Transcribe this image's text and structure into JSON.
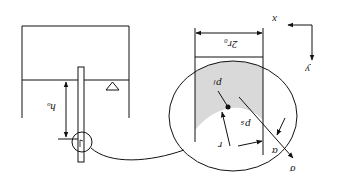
{
  "diagram": {
    "orientation": "rotated 180 degrees",
    "labels": {
      "h_w": "hₒ",
      "two_r0": "2r₀",
      "p_l": "pₗ",
      "p_s": "pₛ",
      "r": "r",
      "alpha": "α",
      "sigma": "σ",
      "x_axis": "x",
      "y_axis": "y"
    },
    "elements": [
      "tank",
      "capillary-tube",
      "water-level-marker",
      "magnified-view-circle",
      "meniscus",
      "coordinate-axes"
    ],
    "colors": {
      "line": "#111111",
      "fill_liquid": "#d9d9d9",
      "background": "#ffffff"
    }
  }
}
